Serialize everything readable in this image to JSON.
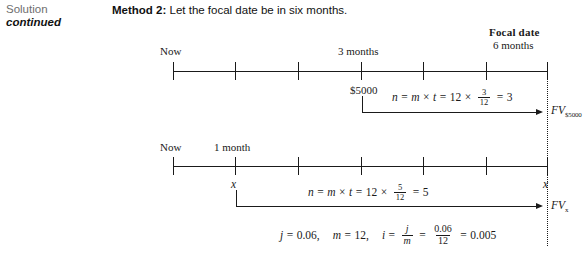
{
  "margin": {
    "solution": "Solution",
    "continued": "continued"
  },
  "heading": {
    "bold_part": "Method 2:",
    "rest": " Let the focal date be in six months."
  },
  "focal": {
    "title": "Focal date",
    "subtitle": "6 months"
  },
  "timeline_one": {
    "name": "focal-date-six-months-timeline-top",
    "left_label": "Now",
    "mid_label": "3 months",
    "amount_label": "$5000",
    "ticks": 7,
    "equation": {
      "lhs_n": "n",
      "eq1": "=",
      "m": "m",
      "times1": "×",
      "t": "t",
      "eq2": "=",
      "twelve": "12",
      "times2": "×",
      "frac_num": "3",
      "frac_den": "12",
      "eq3": "=",
      "result": "3"
    },
    "future_value": "FV",
    "future_value_sub": "$5000"
  },
  "timeline_two": {
    "name": "focal-date-six-months-timeline-bottom",
    "left_label": "Now",
    "mid_label": "1 month",
    "x_start_label": "x",
    "x_end_label": "x",
    "ticks": 7,
    "equation": {
      "lhs_n": "n",
      "eq1": "=",
      "m": "m",
      "times1": "×",
      "t": "t",
      "eq2": "=",
      "twelve": "12",
      "times2": "×",
      "frac_num": "5",
      "frac_den": "12",
      "eq3": "=",
      "result": "5"
    },
    "future_value": "FV",
    "future_value_sub": "x"
  },
  "parameters": {
    "j_symbol": "j",
    "j_eq": "=",
    "j_value": "0.06,",
    "m_symbol": "m",
    "m_eq": "=",
    "m_value": "12,",
    "i_symbol": "i",
    "i_eq": "=",
    "i_frac_num": "j",
    "i_frac_den": "m",
    "i_eq2": "=",
    "i_frac2_num": "0.06",
    "i_frac2_den": "12",
    "i_eq3": "=",
    "i_value": "0.005"
  },
  "colors": {
    "ink": "#1a1a1a",
    "gray_label": "#6e6e6e",
    "page": "#ffffff"
  }
}
